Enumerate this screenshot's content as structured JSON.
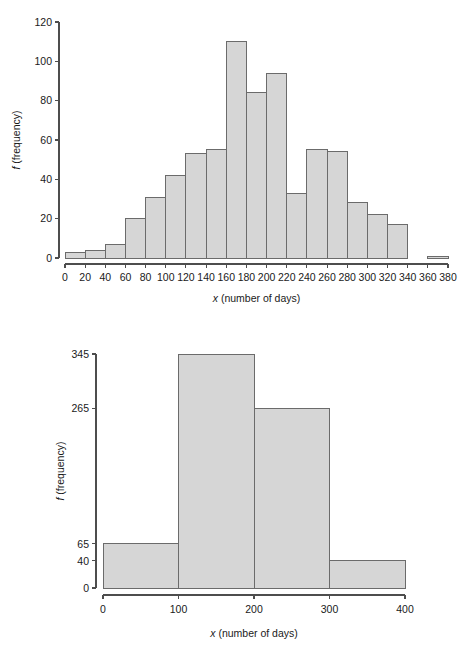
{
  "page": {
    "title": "Two histograms of number of days",
    "background_color": "#ffffff",
    "bar_fill_color": "#d6d6d6",
    "bar_stroke_color": "#6b6b6b",
    "axis_color": "#4d4d4d",
    "text_color": "#1a1a1a"
  },
  "chart_data": [
    {
      "id": "top-histogram",
      "type": "bar",
      "title": "",
      "subtitle": "",
      "xlabel": "x (number of days)",
      "xlabel_italic_prefix": "x",
      "xlabel_rest": " (number of days)",
      "ylabel": "f (frequency)",
      "ylabel_italic_prefix": "f",
      "ylabel_rest": " (frequency)",
      "grid": false,
      "legend": false,
      "legend_position": "none",
      "bin_width": 20,
      "xlim": [
        0,
        380
      ],
      "ylim": [
        0,
        120
      ],
      "xticks": [
        0,
        20,
        40,
        60,
        80,
        100,
        120,
        140,
        160,
        180,
        200,
        220,
        240,
        260,
        280,
        300,
        320,
        340,
        360,
        380
      ],
      "xticklabels": [
        "0",
        "20",
        "40",
        "60",
        "80",
        "100",
        "120",
        "140",
        "160",
        "180",
        "200",
        "220",
        "240",
        "260",
        "280",
        "300",
        "320",
        "340",
        "360",
        "380"
      ],
      "yticks": [
        0,
        20,
        40,
        60,
        80,
        100,
        120
      ],
      "yticklabels": [
        "0",
        "20",
        "40",
        "60",
        "80",
        "100",
        "120"
      ],
      "bin_edges": [
        0,
        20,
        40,
        60,
        80,
        100,
        120,
        140,
        160,
        180,
        200,
        220,
        240,
        260,
        280,
        300,
        320,
        340,
        360,
        380
      ],
      "categories": [
        "0-20",
        "20-40",
        "40-60",
        "60-80",
        "80-100",
        "100-120",
        "120-140",
        "140-160",
        "160-180",
        "180-200",
        "200-220",
        "220-240",
        "240-260",
        "260-280",
        "280-300",
        "300-320",
        "320-340",
        "340-360",
        "360-380"
      ],
      "values": [
        3,
        4,
        7,
        20,
        31,
        42,
        53,
        55,
        110,
        84,
        94,
        33,
        55,
        54,
        28,
        22,
        17,
        0,
        1
      ]
    },
    {
      "id": "bottom-histogram",
      "type": "bar",
      "title": "",
      "subtitle": "",
      "xlabel": "x (number of days)",
      "xlabel_italic_prefix": "x",
      "xlabel_rest": " (number of days)",
      "ylabel": "f (frequency)",
      "ylabel_italic_prefix": "f",
      "ylabel_rest": " (frequency)",
      "grid": false,
      "legend": false,
      "legend_position": "none",
      "bin_width": 100,
      "xlim": [
        0,
        400
      ],
      "ylim": [
        0,
        345
      ],
      "xticks": [
        0,
        100,
        200,
        300,
        400
      ],
      "xticklabels": [
        "0",
        "100",
        "200",
        "300",
        "400"
      ],
      "yticks": [
        0,
        40,
        65,
        265,
        345
      ],
      "yticklabels": [
        "0",
        "40",
        "65",
        "265",
        "345"
      ],
      "bin_edges": [
        0,
        100,
        200,
        300,
        400
      ],
      "categories": [
        "0-100",
        "100-200",
        "200-300",
        "300-400"
      ],
      "values": [
        65,
        345,
        265,
        40
      ]
    }
  ]
}
